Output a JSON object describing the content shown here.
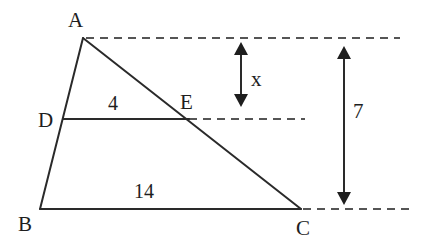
{
  "diagram": {
    "type": "similar-triangles-trapezoid",
    "points": {
      "A": {
        "label": "A",
        "x": 83,
        "y": 38
      },
      "B": {
        "label": "B",
        "x": 40,
        "y": 209
      },
      "C": {
        "label": "C",
        "x": 301,
        "y": 209
      },
      "D": {
        "label": "D",
        "x": 63,
        "y": 118
      },
      "E": {
        "label": "E",
        "x": 187,
        "y": 118
      }
    },
    "segments": {
      "DE": {
        "length_label": "4"
      },
      "BC": {
        "length_label": "14"
      }
    },
    "dimensions": {
      "x": {
        "label": "x",
        "from": "A-level",
        "to": "DE-level"
      },
      "height": {
        "label": "7",
        "from": "A-level",
        "to": "BC-level"
      }
    },
    "colors": {
      "line": "#2a2a2a",
      "dashed": "#555555",
      "text": "#1e1e1e",
      "background": "#ffffff"
    }
  }
}
